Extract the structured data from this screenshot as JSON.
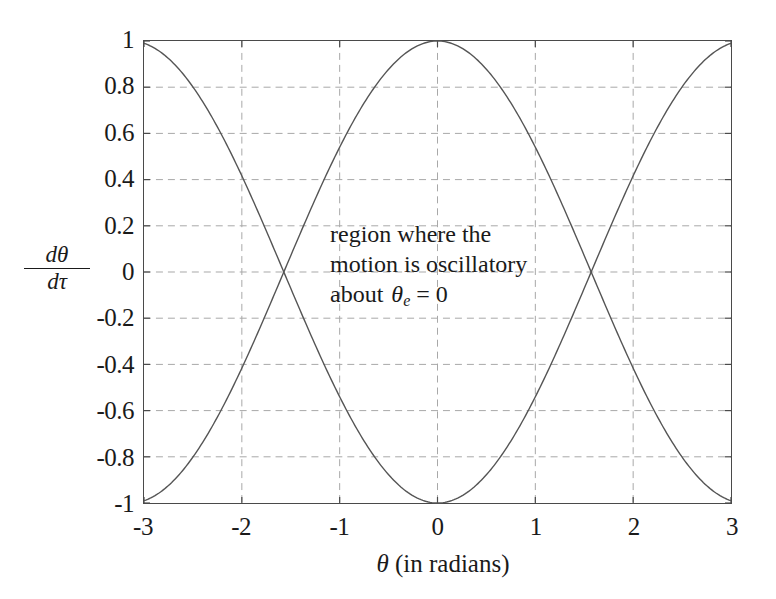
{
  "chart_data": {
    "type": "line",
    "title": "",
    "xlabel": "θ (in radians)",
    "ylabel_numerator": "dθ",
    "ylabel_denominator": "dτ",
    "xlim": [
      -3,
      3
    ],
    "ylim": [
      -1,
      1
    ],
    "xticks": [
      "-3",
      "-2",
      "-1",
      "0",
      "1",
      "2",
      "3"
    ],
    "xtick_values": [
      -3,
      -2,
      -1,
      0,
      1,
      2,
      3
    ],
    "yticks": [
      "1",
      "0.8",
      "0.6",
      "0.4",
      "0.2",
      "0",
      "-0.2",
      "-0.4",
      "-0.6",
      "-0.8",
      "-1"
    ],
    "ytick_values": [
      1,
      0.8,
      0.6,
      0.4,
      0.2,
      0,
      -0.2,
      -0.4,
      -0.6,
      -0.8,
      -1
    ],
    "grid": true,
    "grid_style": "dashed",
    "grid_color": "#a8a8a8",
    "legend": "none",
    "axis_color": "#4a4a4a",
    "curve_color": "#555555",
    "background": "#ffffff",
    "series": [
      {
        "name": "upper separatrix",
        "formula": "cos(theta)",
        "x": [
          -3,
          -2.8,
          -2.6,
          -2.4,
          -2.2,
          -2,
          -1.8,
          -1.6,
          -1.4,
          -1.2,
          -1,
          -0.8,
          -0.6,
          -0.4,
          -0.2,
          0,
          0.2,
          0.4,
          0.6,
          0.8,
          1,
          1.2,
          1.4,
          1.6,
          1.8,
          2,
          2.2,
          2.4,
          2.6,
          2.8,
          3
        ],
        "y": [
          -0.99,
          -0.942,
          -0.857,
          -0.737,
          -0.589,
          -0.416,
          -0.227,
          -0.029,
          0.17,
          0.362,
          0.54,
          0.697,
          0.825,
          0.921,
          0.98,
          1,
          0.98,
          0.921,
          0.825,
          0.697,
          0.54,
          0.362,
          0.17,
          -0.029,
          -0.227,
          -0.416,
          -0.589,
          -0.737,
          -0.857,
          -0.942,
          -0.99
        ]
      },
      {
        "name": "lower separatrix",
        "formula": "-cos(theta)",
        "x": [
          -3,
          -2.8,
          -2.6,
          -2.4,
          -2.2,
          -2,
          -1.8,
          -1.6,
          -1.4,
          -1.2,
          -1,
          -0.8,
          -0.6,
          -0.4,
          -0.2,
          0,
          0.2,
          0.4,
          0.6,
          0.8,
          1,
          1.2,
          1.4,
          1.6,
          1.8,
          2,
          2.2,
          2.4,
          2.6,
          2.8,
          3
        ],
        "y": [
          0.99,
          0.942,
          0.857,
          0.737,
          0.589,
          0.416,
          0.227,
          0.029,
          -0.17,
          -0.362,
          -0.54,
          -0.697,
          -0.825,
          -0.921,
          -0.98,
          -1,
          -0.98,
          -0.921,
          -0.825,
          -0.697,
          -0.54,
          -0.362,
          -0.17,
          0.029,
          0.227,
          0.416,
          0.589,
          0.737,
          0.857,
          0.942,
          0.99
        ]
      }
    ],
    "annotations": [
      {
        "name": "oscillatory-region-note",
        "line1": "region where the",
        "line2": "motion is oscillatory",
        "line3_prefix": "about",
        "line3_symbol": "θ",
        "line3_subscript": "e",
        "line3_suffix": "= 0",
        "x": 0.15,
        "y": 0.22
      }
    ]
  }
}
